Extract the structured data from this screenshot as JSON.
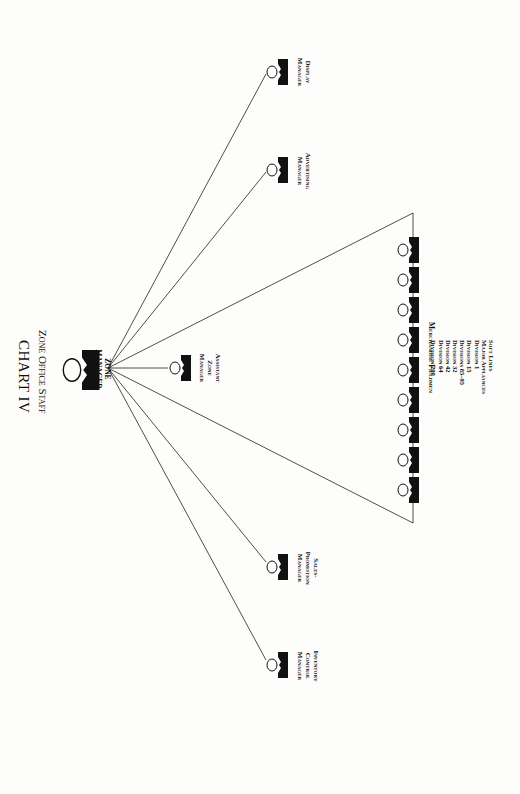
{
  "chart": {
    "title": "CHART IV",
    "subtitle": "Zone Office Staff"
  },
  "zone_manager": {
    "line1": "ZONE",
    "line2": "MANAGER"
  },
  "positions": [
    {
      "id": "display-manager",
      "lines": [
        "Display",
        "Manager"
      ]
    },
    {
      "id": "advertising-manager",
      "lines": [
        "Advertising",
        "Manager"
      ]
    },
    {
      "id": "assistant-zone-manager",
      "lines": [
        "Assistant",
        "Zone",
        "Manager"
      ]
    },
    {
      "id": "sales-promotion-manager",
      "lines": [
        "Sales-",
        "Promotion",
        "Manager"
      ]
    },
    {
      "id": "inventory-control-manager",
      "lines": [
        "Inventory",
        "Control",
        "Manager"
      ]
    }
  ],
  "fieldmen": {
    "title": "Merchandise Fieldmen",
    "count": 9,
    "divisions": [
      "Soft Lines",
      "Major Appliances",
      "Division 1",
      "Division 15",
      "Divisions 85–95",
      "Division 32",
      "Division 42",
      "Division 64",
      "Division 200"
    ]
  },
  "colors": {
    "ink": "#111111",
    "paper": "#fdfdfb"
  }
}
